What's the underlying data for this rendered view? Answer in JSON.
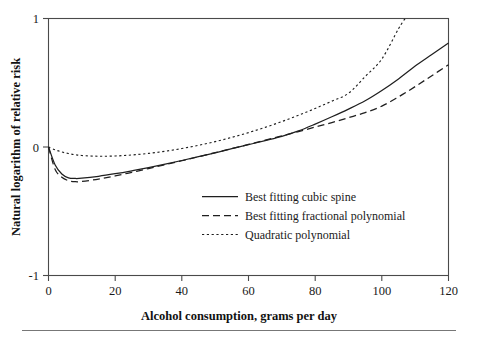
{
  "chart_data": {
    "type": "line",
    "title": "",
    "xlabel": "Alcohol consumption, grams per day",
    "ylabel": "Natural logarithm of relative risk",
    "xlim": [
      0,
      120
    ],
    "ylim": [
      -1,
      1
    ],
    "xticks": [
      0,
      20,
      40,
      60,
      80,
      100,
      120
    ],
    "yticks": [
      1,
      0,
      -1
    ],
    "xtick_labels": [
      "0",
      "20",
      "40",
      "60",
      "80",
      "100",
      "120"
    ],
    "ytick_labels": [
      "1",
      "0",
      "-1"
    ],
    "grid": false,
    "legend_position": "center-right",
    "series": [
      {
        "name": "Best fitting cubic spine",
        "style": "solid",
        "x": [
          0,
          2,
          4,
          6,
          8,
          10,
          15,
          20,
          25,
          30,
          35,
          40,
          45,
          50,
          55,
          60,
          65,
          70,
          75,
          80,
          85,
          90,
          95,
          100,
          105,
          110,
          115,
          120
        ],
        "y": [
          0.0,
          -0.14,
          -0.21,
          -0.24,
          -0.245,
          -0.243,
          -0.228,
          -0.208,
          -0.185,
          -0.16,
          -0.133,
          -0.105,
          -0.075,
          -0.045,
          -0.013,
          0.018,
          0.05,
          0.083,
          0.125,
          0.178,
          0.235,
          0.295,
          0.36,
          0.44,
          0.53,
          0.63,
          0.72,
          0.81
        ]
      },
      {
        "name": "Best fitting fractional polynomial",
        "style": "dashed",
        "x": [
          0,
          2,
          4,
          6,
          8,
          10,
          15,
          20,
          25,
          30,
          35,
          40,
          45,
          50,
          55,
          60,
          65,
          70,
          75,
          80,
          85,
          90,
          95,
          100,
          105,
          110,
          115,
          120
        ],
        "y": [
          0.0,
          -0.175,
          -0.235,
          -0.262,
          -0.27,
          -0.268,
          -0.25,
          -0.225,
          -0.197,
          -0.168,
          -0.138,
          -0.107,
          -0.076,
          -0.044,
          -0.012,
          0.02,
          0.053,
          0.086,
          0.12,
          0.155,
          0.19,
          0.228,
          0.268,
          0.318,
          0.39,
          0.47,
          0.555,
          0.64
        ]
      },
      {
        "name": "Quadratic polynomial",
        "style": "dotted",
        "x": [
          0,
          2,
          4,
          6,
          8,
          10,
          15,
          20,
          25,
          30,
          35,
          40,
          45,
          50,
          55,
          60,
          65,
          70,
          75,
          80,
          85,
          90,
          95,
          100,
          105,
          107
        ],
        "y": [
          0.0,
          -0.022,
          -0.039,
          -0.051,
          -0.06,
          -0.066,
          -0.072,
          -0.07,
          -0.062,
          -0.05,
          -0.033,
          -0.012,
          0.013,
          0.042,
          0.075,
          0.112,
          0.153,
          0.198,
          0.247,
          0.3,
          0.357,
          0.418,
          0.548,
          0.685,
          0.92,
          1.0
        ]
      }
    ]
  },
  "legend": {
    "items": [
      {
        "label": "Best fitting cubic spine",
        "style": "solid"
      },
      {
        "label": "Best fitting fractional polynomial",
        "style": "dashed"
      },
      {
        "label": "Quadratic polynomial",
        "style": "dotted"
      }
    ]
  },
  "colors": {
    "line": "#1f1f1f",
    "axis": "#4a4a4a",
    "text": "#1a1a1a",
    "background": "#ffffff",
    "rule": "#777777"
  }
}
